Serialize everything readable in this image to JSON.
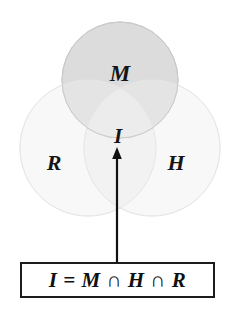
{
  "figure": {
    "type": "venn-diagram",
    "sets": [
      {
        "id": "M",
        "label": "M",
        "fill": "#dcdcdc",
        "stroke": "#c4c4c4",
        "center": [
          120,
          80
        ],
        "radius": 58
      },
      {
        "id": "R",
        "label": "R",
        "fill": "#f7f7f7",
        "stroke": "#ededed",
        "center": [
          88,
          148
        ],
        "radius": 68
      },
      {
        "id": "H",
        "label": "H",
        "fill": "#f7f7f7",
        "stroke": "#ededed",
        "center": [
          152,
          148
        ],
        "radius": 68
      }
    ],
    "intersection": {
      "label": "I",
      "position": [
        118,
        136
      ]
    },
    "arrow": {
      "name": "callout-arrow",
      "from": [
        117,
        262
      ],
      "to": [
        117,
        148
      ],
      "color": "#111111"
    },
    "formula": {
      "text": "I  =  M ∩ H ∩ R",
      "border_color": "#1c1c1c",
      "background": "#ffffff"
    },
    "colors": {
      "background": "#ffffff",
      "text": "#101010",
      "m_fill": "#dcdcdc",
      "rh_fill": "#f7f7f7"
    }
  }
}
